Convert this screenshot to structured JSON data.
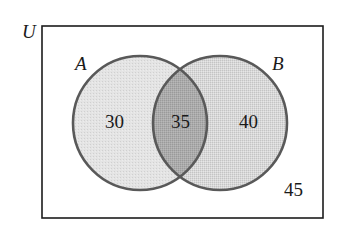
{
  "diagram": {
    "type": "venn",
    "universe": {
      "label": "U",
      "outside_count": "45"
    },
    "sets": [
      {
        "label": "A",
        "only_count": "30"
      },
      {
        "label": "B",
        "only_count": "40"
      }
    ],
    "intersection": {
      "label": "A∩B",
      "count": "35"
    },
    "colors": {
      "border": "#1c1c1c",
      "circle_outline": "#595959",
      "set_a_fill": "#e2e2e2",
      "set_b_fill": "#d4d4d4",
      "intersection_fill": "#a9a9a9",
      "background": "#ffffff"
    }
  }
}
